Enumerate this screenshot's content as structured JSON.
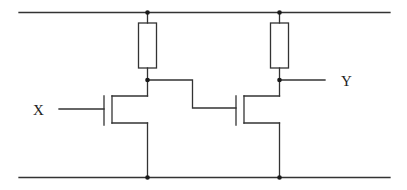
{
  "diagram": {
    "type": "circuit-schematic",
    "colors": {
      "background": "#ffffff",
      "wire": "#333333",
      "node": "#1a1a1a"
    },
    "labels": {
      "input": "X",
      "output": "Y"
    },
    "rails": [
      {
        "name": "supply-rail",
        "y": 12.5,
        "x1": 19,
        "x2": 390
      },
      {
        "name": "ground-rail",
        "y": 177.5,
        "x1": 19,
        "x2": 390
      }
    ],
    "components": [
      {
        "id": "R1",
        "kind": "resistor",
        "x": 138.5,
        "y": 23,
        "w": 18,
        "h": 45
      },
      {
        "id": "R2",
        "kind": "resistor",
        "x": 270,
        "y": 23,
        "w": 18,
        "h": 45
      },
      {
        "id": "M1",
        "kind": "nmos-transistor",
        "gate_x": 104,
        "channel_x": 112,
        "drain_y": 96,
        "source_y": 123
      },
      {
        "id": "M2",
        "kind": "nmos-transistor",
        "gate_x": 236,
        "channel_x": 244,
        "drain_y": 96,
        "source_y": 123
      }
    ]
  }
}
